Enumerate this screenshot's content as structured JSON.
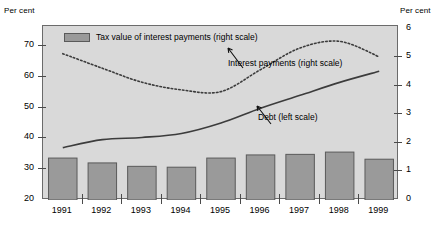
{
  "figure": {
    "left_axis_unit": "Per cent",
    "right_axis_unit": "Per cent",
    "background_color": "#d9d9d9",
    "bar_color": "#9a9a9a",
    "line_color": "#3c3c3c"
  },
  "legend": {
    "entries": [
      {
        "label": "Tax value of interest payments (right scale)",
        "swatch": "bar"
      }
    ]
  },
  "annotations": [
    {
      "name": "interest-payments-annotation",
      "text": "Interest payments (right scale)"
    },
    {
      "name": "debt-annotation",
      "text": "Debt (left scale)"
    }
  ],
  "chart_data": {
    "type": "bar",
    "title": "",
    "subtitle": "",
    "xlabel": "",
    "ylabel": "Per cent",
    "y2label": "Per cent",
    "categories": [
      "1991",
      "1992",
      "1993",
      "1994",
      "1995",
      "1996",
      "1997",
      "1998",
      "1999"
    ],
    "ylim": [
      20,
      76.5
    ],
    "yticks": [
      20,
      30,
      40,
      50,
      60,
      70
    ],
    "ytick_labels": [
      "20",
      "30",
      "40",
      "50",
      "60",
      "70"
    ],
    "y2lim": [
      0,
      6.1
    ],
    "y2ticks": [
      0,
      1,
      2,
      3,
      4,
      5,
      6
    ],
    "y2tick_labels": [
      "0",
      "1",
      "2",
      "3",
      "4",
      "5",
      "6"
    ],
    "grid": false,
    "legend_position": "top-left inside",
    "series": [
      {
        "name": "Tax value of interest payments (right scale)",
        "type": "bar",
        "axis": "right",
        "values": [
          1.47,
          1.3,
          1.18,
          1.15,
          1.47,
          1.58,
          1.6,
          1.68,
          1.43
        ]
      },
      {
        "name": "Interest payments (right scale)",
        "type": "line",
        "style": "dotted",
        "axis": "right",
        "values": [
          5.13,
          4.62,
          4.13,
          3.86,
          3.8,
          4.57,
          5.33,
          5.56,
          5.02
        ]
      },
      {
        "name": "Debt (left scale)",
        "type": "line",
        "style": "solid",
        "axis": "left",
        "values": [
          37.0,
          39.6,
          40.3,
          41.6,
          45.0,
          49.8,
          54.0,
          58.2,
          61.8
        ]
      }
    ]
  }
}
